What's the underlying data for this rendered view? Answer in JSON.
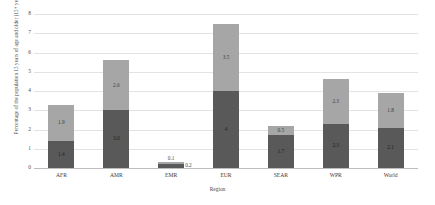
{
  "chart_data": {
    "type": "bar",
    "subtype": "stacked-bar",
    "title": "",
    "xlabel": "Region",
    "ylabel": "Percentage of the population 15 years of age and older (15+ years)",
    "categories": [
      "AFR",
      "AMR",
      "EMR",
      "EUR",
      "SEAR",
      "WPR",
      "World"
    ],
    "series": [
      {
        "name": "lower-segment",
        "values": [
          1.4,
          3.0,
          0.2,
          4.0,
          1.7,
          2.3,
          2.1
        ],
        "color": "#595959"
      },
      {
        "name": "upper-segment",
        "values": [
          1.9,
          2.6,
          0.1,
          3.5,
          0.5,
          2.3,
          1.8
        ],
        "color": "#a6a6a6"
      }
    ],
    "totals": [
      3.3,
      5.6,
      0.3,
      7.5,
      2.2,
      4.6,
      3.9
    ],
    "ylim": [
      0,
      8
    ],
    "yticks": [
      0,
      1,
      2,
      3,
      4,
      5,
      6,
      7,
      8
    ],
    "ytick_labels": [
      "0",
      "1",
      "2",
      "3",
      "4",
      "5",
      "6",
      "7",
      "8"
    ],
    "grid": true,
    "legend": "none",
    "data_labels": [
      {
        "category": "AFR",
        "lower": "1.4",
        "upper": "1.9"
      },
      {
        "category": "AMR",
        "lower": "3.0",
        "upper": "2.6"
      },
      {
        "category": "EMR",
        "lower": "0.2",
        "upper": "0.1"
      },
      {
        "category": "EUR",
        "lower": "4",
        "upper": "3.5"
      },
      {
        "category": "SEAR",
        "lower": "1.7",
        "upper": "0.5"
      },
      {
        "category": "WPR",
        "lower": "2.3",
        "upper": "2.3"
      },
      {
        "category": "World",
        "lower": "2.1",
        "upper": "1.8"
      }
    ],
    "colors": {
      "lower_segment": "#595959",
      "upper_segment": "#a6a6a6",
      "gridline": "#e3e3e3",
      "axis": "#bdbdbd",
      "text": "#3a3a3a",
      "background": "#ffffff"
    }
  }
}
